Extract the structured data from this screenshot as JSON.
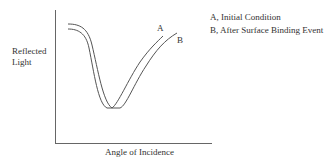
{
  "diagram": {
    "y_axis_label_line1": "Reflected",
    "y_axis_label_line2": "Light",
    "x_axis_label": "Angle of Incidence",
    "curve_a_label": "A",
    "curve_b_label": "B",
    "legend": [
      {
        "text": "A, Initial Condition"
      },
      {
        "text": "B, After Surface Binding Event"
      }
    ],
    "colors": {
      "line": "#555555",
      "axis": "#666666",
      "text": "#333333"
    }
  }
}
